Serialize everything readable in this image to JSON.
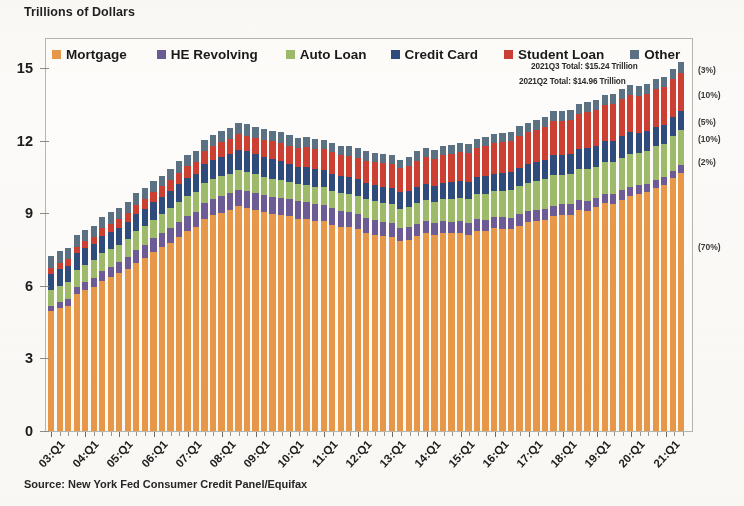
{
  "axis_title": "Trillions of Dollars",
  "source": "Source: New York Fed Consumer Credit Panel/Equifax",
  "annotations": {
    "q3": "2021Q3 Total: $15.24 Trillion",
    "q2": "2021Q2 Total: $14.96 Trillion"
  },
  "right_pct_labels": [
    {
      "label": "(3%)",
      "series": "Other",
      "y_value": 14.9
    },
    {
      "label": "(10%)",
      "series": "Student Loan",
      "y_value": 13.9
    },
    {
      "label": "(5%)",
      "series": "Credit Card",
      "y_value": 12.75
    },
    {
      "label": "(10%)",
      "series": "Auto Loan",
      "y_value": 12.05
    },
    {
      "label": "(2%)",
      "series": "HE Revolving",
      "y_value": 11.1
    },
    {
      "label": "(70%)",
      "series": "Mortgage",
      "y_value": 7.6
    }
  ],
  "colors": {
    "mortgage": "#e89848",
    "he_revolving": "#6c5b96",
    "auto_loan": "#9dbb6a",
    "credit_card": "#2e4b7c",
    "student_loan": "#cc3f33",
    "other": "#5b7184",
    "frame": "#b9b5ad",
    "background": "#fbfaf8"
  },
  "chart_data": {
    "type": "bar",
    "stacked": true,
    "title": "",
    "subtitle": "",
    "xlabel": "",
    "ylabel": "Trillions of Dollars",
    "ylim": [
      0,
      16.2
    ],
    "yticks": [
      0,
      3,
      6,
      9,
      12,
      15
    ],
    "grid": false,
    "legend_position": "top-inside",
    "legend": [
      "Mortgage",
      "HE Revolving",
      "Auto Loan",
      "Credit Card",
      "Student Loan",
      "Other"
    ],
    "x_tick_labels": [
      "03:Q1",
      "04:Q1",
      "05:Q1",
      "06:Q1",
      "07:Q1",
      "08:Q1",
      "09:Q1",
      "10:Q1",
      "11:Q1",
      "12:Q1",
      "13:Q1",
      "14:Q1",
      "15:Q1",
      "16:Q1",
      "17:Q1",
      "18:Q1",
      "19:Q1",
      "20:Q1",
      "21:Q1"
    ],
    "x": [
      "03:Q1",
      "03:Q2",
      "03:Q3",
      "03:Q4",
      "04:Q1",
      "04:Q2",
      "04:Q3",
      "04:Q4",
      "05:Q1",
      "05:Q2",
      "05:Q3",
      "05:Q4",
      "06:Q1",
      "06:Q2",
      "06:Q3",
      "06:Q4",
      "07:Q1",
      "07:Q2",
      "07:Q3",
      "07:Q4",
      "08:Q1",
      "08:Q2",
      "08:Q3",
      "08:Q4",
      "09:Q1",
      "09:Q2",
      "09:Q3",
      "09:Q4",
      "10:Q1",
      "10:Q2",
      "10:Q3",
      "10:Q4",
      "11:Q1",
      "11:Q2",
      "11:Q3",
      "11:Q4",
      "12:Q1",
      "12:Q2",
      "12:Q3",
      "12:Q4",
      "13:Q1",
      "13:Q2",
      "13:Q3",
      "13:Q4",
      "14:Q1",
      "14:Q2",
      "14:Q3",
      "14:Q4",
      "15:Q1",
      "15:Q2",
      "15:Q3",
      "15:Q4",
      "16:Q1",
      "16:Q2",
      "16:Q3",
      "16:Q4",
      "17:Q1",
      "17:Q2",
      "17:Q3",
      "17:Q4",
      "18:Q1",
      "18:Q2",
      "18:Q3",
      "18:Q4",
      "19:Q1",
      "19:Q2",
      "19:Q3",
      "19:Q4",
      "20:Q1",
      "20:Q2",
      "20:Q3",
      "20:Q4",
      "21:Q1",
      "21:Q2",
      "21:Q3"
    ],
    "series": [
      {
        "name": "Mortgage",
        "color": "#e89848",
        "values": [
          4.94,
          5.08,
          5.18,
          5.66,
          5.84,
          5.97,
          6.21,
          6.36,
          6.51,
          6.69,
          6.95,
          7.14,
          7.38,
          7.59,
          7.79,
          8.02,
          8.25,
          8.43,
          8.76,
          8.91,
          9.03,
          9.12,
          9.29,
          9.22,
          9.14,
          9.04,
          8.98,
          8.94,
          8.87,
          8.78,
          8.76,
          8.68,
          8.67,
          8.53,
          8.44,
          8.43,
          8.34,
          8.2,
          8.11,
          8.05,
          8.03,
          7.84,
          7.9,
          8.05,
          8.17,
          8.09,
          8.18,
          8.17,
          8.17,
          8.12,
          8.26,
          8.25,
          8.37,
          8.36,
          8.35,
          8.48,
          8.63,
          8.69,
          8.74,
          8.88,
          8.94,
          8.94,
          9.14,
          9.1,
          9.24,
          9.41,
          9.4,
          9.56,
          9.71,
          9.78,
          9.86,
          10.04,
          10.16,
          10.44,
          10.67
        ],
        "unit": "trillions of dollars"
      },
      {
        "name": "HE Revolving",
        "color": "#6c5b96",
        "values": [
          0.24,
          0.26,
          0.28,
          0.3,
          0.33,
          0.36,
          0.4,
          0.43,
          0.46,
          0.5,
          0.53,
          0.56,
          0.58,
          0.6,
          0.61,
          0.63,
          0.64,
          0.64,
          0.66,
          0.67,
          0.69,
          0.7,
          0.69,
          0.7,
          0.7,
          0.71,
          0.71,
          0.71,
          0.71,
          0.71,
          0.7,
          0.69,
          0.68,
          0.67,
          0.66,
          0.64,
          0.63,
          0.62,
          0.6,
          0.58,
          0.56,
          0.54,
          0.53,
          0.51,
          0.5,
          0.49,
          0.48,
          0.47,
          0.51,
          0.49,
          0.49,
          0.49,
          0.49,
          0.48,
          0.47,
          0.47,
          0.46,
          0.45,
          0.45,
          0.44,
          0.43,
          0.43,
          0.42,
          0.41,
          0.41,
          0.4,
          0.4,
          0.39,
          0.39,
          0.38,
          0.36,
          0.35,
          0.34,
          0.32,
          0.32
        ],
        "unit": "trillions of dollars"
      },
      {
        "name": "Auto Loan",
        "color": "#9dbb6a",
        "values": [
          0.64,
          0.66,
          0.68,
          0.7,
          0.71,
          0.72,
          0.73,
          0.73,
          0.73,
          0.74,
          0.77,
          0.77,
          0.78,
          0.79,
          0.8,
          0.82,
          0.81,
          0.81,
          0.82,
          0.83,
          0.81,
          0.8,
          0.8,
          0.78,
          0.77,
          0.76,
          0.74,
          0.71,
          0.7,
          0.71,
          0.71,
          0.71,
          0.72,
          0.73,
          0.73,
          0.74,
          0.75,
          0.77,
          0.78,
          0.78,
          0.78,
          0.81,
          0.84,
          0.86,
          0.87,
          0.9,
          0.93,
          0.96,
          0.97,
          1.0,
          1.05,
          1.06,
          1.07,
          1.1,
          1.14,
          1.16,
          1.17,
          1.19,
          1.21,
          1.27,
          1.23,
          1.26,
          1.27,
          1.33,
          1.28,
          1.3,
          1.32,
          1.33,
          1.35,
          1.34,
          1.36,
          1.37,
          1.38,
          1.42,
          1.44
        ],
        "unit": "trillions of dollars"
      },
      {
        "name": "Credit Card",
        "color": "#2e4b7c",
        "values": [
          0.69,
          0.69,
          0.69,
          0.7,
          0.7,
          0.69,
          0.7,
          0.7,
          0.71,
          0.7,
          0.72,
          0.72,
          0.72,
          0.71,
          0.72,
          0.73,
          0.75,
          0.74,
          0.78,
          0.79,
          0.81,
          0.83,
          0.85,
          0.87,
          0.85,
          0.83,
          0.81,
          0.8,
          0.76,
          0.73,
          0.73,
          0.73,
          0.7,
          0.69,
          0.69,
          0.7,
          0.68,
          0.67,
          0.67,
          0.68,
          0.66,
          0.67,
          0.67,
          0.68,
          0.66,
          0.66,
          0.68,
          0.7,
          0.68,
          0.7,
          0.71,
          0.75,
          0.71,
          0.73,
          0.75,
          0.78,
          0.76,
          0.78,
          0.81,
          0.83,
          0.81,
          0.83,
          0.84,
          0.87,
          0.85,
          0.87,
          0.88,
          0.93,
          0.89,
          0.82,
          0.81,
          0.82,
          0.77,
          0.79,
          0.8
        ],
        "unit": "trillions of dollars"
      },
      {
        "name": "Student Loan",
        "color": "#cc3f33",
        "values": [
          0.24,
          0.25,
          0.26,
          0.25,
          0.26,
          0.26,
          0.33,
          0.35,
          0.36,
          0.37,
          0.39,
          0.39,
          0.4,
          0.42,
          0.45,
          0.48,
          0.49,
          0.5,
          0.55,
          0.58,
          0.59,
          0.61,
          0.64,
          0.64,
          0.66,
          0.69,
          0.73,
          0.75,
          0.76,
          0.76,
          0.85,
          0.85,
          0.87,
          0.9,
          0.87,
          0.87,
          0.9,
          0.92,
          0.96,
          0.97,
          0.99,
          0.99,
          1.03,
          1.08,
          1.11,
          1.12,
          1.13,
          1.16,
          1.19,
          1.19,
          1.2,
          1.23,
          1.26,
          1.26,
          1.28,
          1.31,
          1.34,
          1.34,
          1.36,
          1.38,
          1.41,
          1.41,
          1.44,
          1.46,
          1.49,
          1.48,
          1.5,
          1.51,
          1.54,
          1.54,
          1.55,
          1.56,
          1.57,
          1.57,
          1.58
        ],
        "unit": "trillions of dollars"
      },
      {
        "name": "Other",
        "color": "#5b7184",
        "values": [
          0.48,
          0.48,
          0.48,
          0.48,
          0.48,
          0.47,
          0.47,
          0.47,
          0.46,
          0.46,
          0.46,
          0.46,
          0.46,
          0.45,
          0.46,
          0.46,
          0.46,
          0.46,
          0.47,
          0.47,
          0.47,
          0.47,
          0.47,
          0.47,
          0.46,
          0.45,
          0.44,
          0.43,
          0.42,
          0.42,
          0.41,
          0.41,
          0.4,
          0.4,
          0.39,
          0.39,
          0.38,
          0.38,
          0.38,
          0.38,
          0.37,
          0.37,
          0.37,
          0.38,
          0.37,
          0.37,
          0.37,
          0.38,
          0.37,
          0.38,
          0.38,
          0.39,
          0.38,
          0.38,
          0.38,
          0.39,
          0.39,
          0.39,
          0.4,
          0.41,
          0.4,
          0.41,
          0.41,
          0.42,
          0.41,
          0.42,
          0.42,
          0.43,
          0.42,
          0.41,
          0.41,
          0.42,
          0.42,
          0.42,
          0.43
        ],
        "unit": "trillions of dollars"
      }
    ],
    "totals_note": {
      "2021Q3": 15.24,
      "2021Q2": 14.96
    }
  }
}
